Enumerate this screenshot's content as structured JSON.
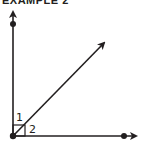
{
  "header": {
    "title": "EXAMPLE 2"
  },
  "diagram": {
    "angle_labels": [
      "1",
      "2"
    ],
    "colors": {
      "stroke": "#231f20"
    }
  }
}
